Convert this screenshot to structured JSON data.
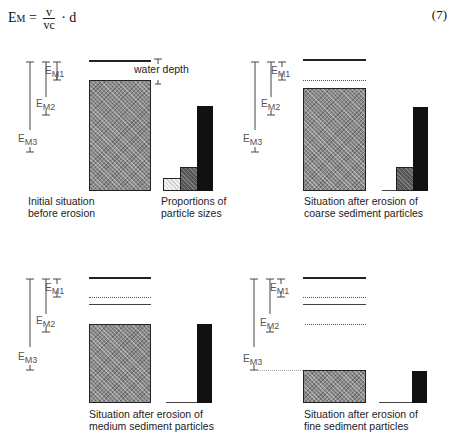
{
  "equation": {
    "lhs": "E",
    "lhs_sub": "M",
    "numerator": "v",
    "denominator": "vc",
    "rhs": "· d",
    "number": "(7)"
  },
  "scale_labels": {
    "m1": {
      "main": "E",
      "sub": "M1"
    },
    "m2": {
      "main": "E",
      "sub": "M2"
    },
    "m3": {
      "main": "E",
      "sub": "M3"
    }
  },
  "panels": [
    {
      "id": "initial",
      "caption_line1": "Initial situation",
      "caption_line2": "before erosion",
      "bars_caption_line1": "Proportions of",
      "bars_caption_line2": "particle sizes",
      "annotation": "water depth"
    },
    {
      "id": "coarse",
      "caption_line1": "Situation after erosion of",
      "caption_line2": "coarse sediment particles"
    },
    {
      "id": "medium",
      "caption_line1": "Situation after erosion of",
      "caption_line2": "medium sediment particles"
    },
    {
      "id": "fine",
      "caption_line1": "Situation after erosion of",
      "caption_line2": "fine sediment particles"
    }
  ],
  "particle_proportions": {
    "classes": [
      "coarse",
      "medium",
      "fine"
    ],
    "initial": [
      1,
      3,
      13
    ],
    "after_coarse": [
      0,
      3,
      13
    ],
    "after_medium": [
      0,
      0,
      13
    ],
    "after_fine": [
      0,
      0,
      4
    ]
  }
}
